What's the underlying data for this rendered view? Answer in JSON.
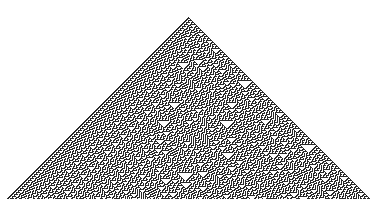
{
  "heading": {
    "text": "Rule 30 cellular automaton",
    "clipped": true
  },
  "automaton": {
    "rule": 30,
    "generations": 182,
    "initial_condition": "single black cell",
    "cell_size_px": 1,
    "apex": {
      "x": 188,
      "y": 17
    },
    "colors": {
      "on": "#2a2a2a",
      "off": "#ffffff",
      "background": "#ffffff"
    }
  }
}
